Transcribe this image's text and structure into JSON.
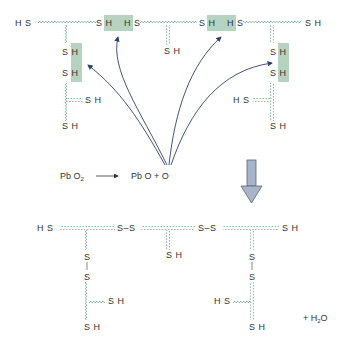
{
  "diagram": {
    "colors": {
      "chain": "#6aa58a",
      "highlight": "#a9cbb7",
      "arrow": "#2e3f6e",
      "big_arrow_fill": "#a8b4c8",
      "big_arrow_stroke": "#5a6478",
      "text": "#333333"
    },
    "top": {
      "labels": {
        "hs_left": "H S",
        "sh_mid1": "S H",
        "hs_mid1": "H S",
        "sh_branch2": "S H",
        "sh_mid2": "S H",
        "hs_mid2": "H S",
        "sh_right": "S H",
        "b1_sh1": "S H",
        "b1_sh2": "S H",
        "b1_side_sh": "S H",
        "b1_bottom_sh": "S H",
        "b3_sh1": "S H",
        "b3_sh2": "S H",
        "b3_side_hs": "H S",
        "b3_bottom_sh": "S H"
      }
    },
    "reaction": {
      "reactant_pb": "Pb O",
      "reactant_sub": "2",
      "products": "Pb O + O"
    },
    "bottom": {
      "labels": {
        "hs_left": "H S",
        "ss1": "S–S",
        "ss2": "S–S",
        "sh_right": "S H",
        "sh_mid": "S H",
        "b1_s1": "S",
        "b1_s2": "S",
        "b1_side_sh": "S H",
        "b1_bottom_sh": "S H",
        "b3_s1": "S",
        "b3_s2": "S",
        "b3_side_hs": "H S",
        "b3_bottom_sh": "S H"
      },
      "water": {
        "plus": "+ H",
        "sub": "2",
        "o": "O"
      }
    }
  }
}
